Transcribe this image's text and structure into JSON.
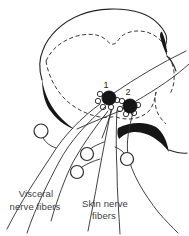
{
  "diagram": {
    "type": "spinal-cord-cross-section",
    "neuron_labels": {
      "first": "1",
      "second": "2"
    },
    "fiber_labels": {
      "visceral": {
        "line1": "Visceral",
        "line2": "nerve fibers"
      },
      "skin": {
        "line1": "Skin nerve",
        "line2": "fibers"
      }
    },
    "counts": {
      "projection_neurons": 2,
      "ganglion_cells": 4,
      "visceral_fibers": 3,
      "skin_fibers": 3
    },
    "colors": {
      "ink": "#222222",
      "label_text": "#404040",
      "neuron_fill": "#161616",
      "background": "#ffffff"
    }
  }
}
